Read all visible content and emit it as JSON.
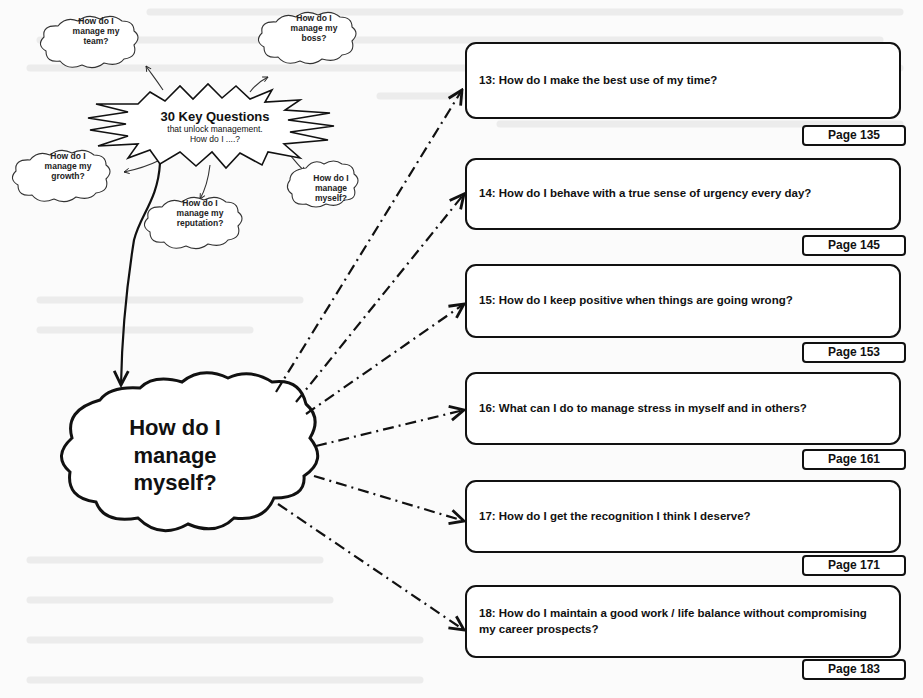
{
  "colors": {
    "ink": "#111111",
    "paper": "#fbfbfb",
    "ghost": "#e6e6e6"
  },
  "overview": {
    "burst": {
      "title": "30 Key Questions",
      "subtitle": "that unlock management.",
      "prompt": "How do I ....?"
    },
    "clouds": [
      {
        "id": "team",
        "lines": [
          "How do I",
          "manage my",
          "team?"
        ]
      },
      {
        "id": "boss",
        "lines": [
          "How do I",
          "manage my",
          "boss?"
        ]
      },
      {
        "id": "growth",
        "lines": [
          "How do I",
          "manage my",
          "growth?"
        ]
      },
      {
        "id": "reputation",
        "lines": [
          "How do I",
          "manage my",
          "reputation?"
        ]
      },
      {
        "id": "myself",
        "lines": [
          "How do I",
          "manage",
          "myself?"
        ]
      }
    ]
  },
  "focus": {
    "lines": [
      "How do I",
      "manage",
      "myself?"
    ]
  },
  "questions": [
    {
      "number": 13,
      "text": "13: How do I make the best use of my time?",
      "page": "Page 135"
    },
    {
      "number": 14,
      "text": "14: How do I behave with a true sense of urgency every day?",
      "page": "Page 145"
    },
    {
      "number": 15,
      "text": "15: How do I keep positive when things are going wrong?",
      "page": "Page 153"
    },
    {
      "number": 16,
      "text": "16: What can I do to manage stress in myself and in others?",
      "page": "Page 161"
    },
    {
      "number": 17,
      "text": "17: How do I get the recognition I think I deserve?",
      "page": "Page 171"
    },
    {
      "number": 18,
      "text": "18: How do I maintain a good work / life balance without compromising my career prospects?",
      "page": "Page 183"
    }
  ]
}
